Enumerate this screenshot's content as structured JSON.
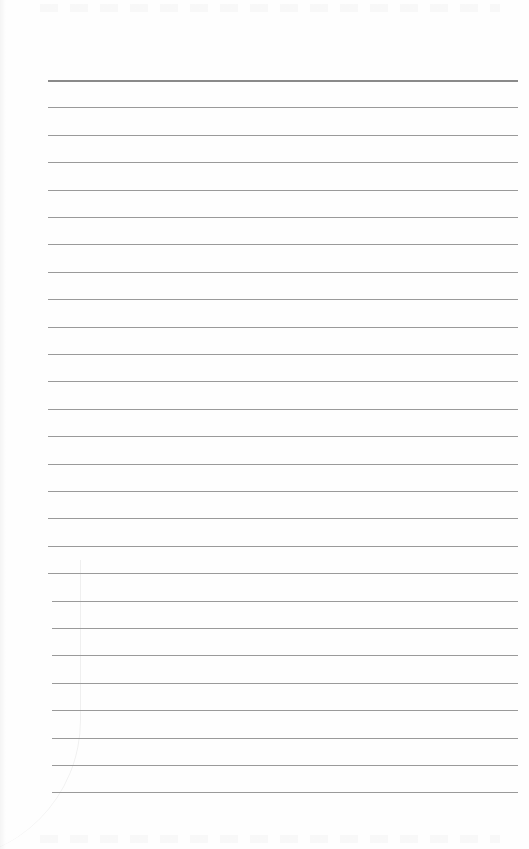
{
  "document": {
    "type": "lined-notebook-page",
    "content_text": "",
    "ruled_lines": {
      "count": 27,
      "first_y": 80,
      "spacing": 27.4,
      "left_x": 48,
      "right_x": 518,
      "line_color": "#9a9a9a",
      "header_line_color": "#8a8a8a"
    },
    "background_color": "#fefefe"
  }
}
